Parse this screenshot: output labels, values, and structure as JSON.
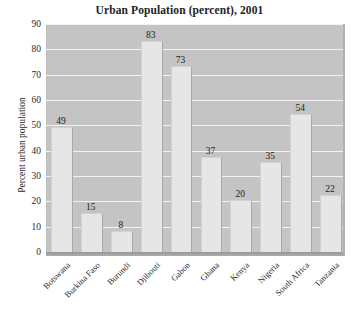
{
  "chart_data": {
    "type": "bar",
    "title": "Urban Population (percent), 2001",
    "xlabel": "",
    "ylabel": "Percent urban population",
    "ylim": [
      0,
      90
    ],
    "ytick_step": 10,
    "yticks": [
      0,
      10,
      20,
      30,
      40,
      50,
      60,
      70,
      80,
      90
    ],
    "grid": true,
    "legend": null,
    "categories": [
      "Botswana",
      "Burkina Faso",
      "Burundi",
      "Djibouti",
      "Gabon",
      "Ghana",
      "Kenya",
      "Nigeria",
      "South Africa",
      "Tanzania"
    ],
    "values": [
      49,
      15,
      8,
      83,
      73,
      37,
      20,
      35,
      54,
      22
    ],
    "value_labels": [
      "49",
      "15",
      "8",
      "83",
      "73",
      "37",
      "20",
      "35",
      "54",
      "22"
    ],
    "colors": {
      "bar_fill": "#e6e6e6",
      "bar_edge": "#a9a9a9",
      "plot_background": "#c4c4c4",
      "gridline": "#f3f3f3",
      "baseline": "#9c9c9c",
      "figure_background": "#ffffff",
      "text": "#2b2b2b"
    }
  }
}
